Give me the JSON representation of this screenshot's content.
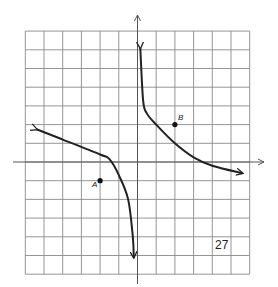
{
  "chart_data": {
    "type": "line",
    "title": "",
    "xlabel": "",
    "ylabel": "",
    "grid": true,
    "xlim": [
      -6,
      6
    ],
    "ylim": [
      -6,
      7
    ],
    "grid_step": 1,
    "series": [
      {
        "name": "left-branch",
        "points": [
          [
            -5.4,
            1.75
          ],
          [
            -4,
            1.2
          ],
          [
            -2,
            0.4
          ],
          [
            -1.5,
            0.15
          ],
          [
            -1,
            -0.7
          ],
          [
            -0.5,
            -2
          ],
          [
            -0.25,
            -4
          ],
          [
            -0.2,
            -5.1
          ]
        ],
        "arrows": "both"
      },
      {
        "name": "right-branch",
        "points": [
          [
            0.15,
            6.1
          ],
          [
            0.3,
            3.3
          ],
          [
            0.5,
            2.6
          ],
          [
            1,
            2
          ],
          [
            2,
            1
          ],
          [
            3,
            0.25
          ],
          [
            4,
            -0.2
          ],
          [
            5.6,
            -0.6
          ]
        ],
        "arrows": "both"
      }
    ],
    "labeled_points": [
      {
        "label": "A",
        "x": -2,
        "y": -1
      },
      {
        "label": "B",
        "x": 2,
        "y": 2
      }
    ],
    "annotations": [
      "27"
    ]
  },
  "figure": {
    "number": "27",
    "point_a_label": "A",
    "point_b_label": "B"
  },
  "colors": {
    "grid": "#8a8a8a",
    "curve": "#222222",
    "axis": "#555555"
  }
}
